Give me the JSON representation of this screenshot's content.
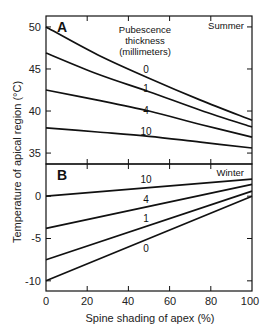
{
  "chart_data": [
    {
      "type": "line",
      "panel": "A",
      "season": "Summer",
      "title": "",
      "xlabel": "Spine shading of apex (%)",
      "ylabel": "Temperature of apical region (°C)",
      "xlim": [
        0,
        100
      ],
      "ylim": [
        33.7,
        51.3
      ],
      "yticks": [
        35,
        40,
        45,
        50
      ],
      "xticks": [
        0,
        20,
        40,
        60,
        80,
        100
      ],
      "legend_title": [
        "Pubescence",
        "thickness",
        "(millimeters)"
      ],
      "x": [
        0,
        25,
        50,
        75,
        100
      ],
      "series": [
        {
          "name": "0",
          "values": [
            50.0,
            46.7,
            43.9,
            41.3,
            38.9
          ]
        },
        {
          "name": "1",
          "values": [
            46.9,
            44.4,
            42.3,
            40.1,
            38.1
          ]
        },
        {
          "name": "4",
          "values": [
            42.5,
            41.3,
            40.0,
            38.4,
            36.9
          ]
        },
        {
          "name": "10",
          "values": [
            38.0,
            37.5,
            37.0,
            36.3,
            35.6
          ]
        }
      ],
      "grid": false
    },
    {
      "type": "line",
      "panel": "B",
      "season": "Winter",
      "title": "",
      "xlabel": "Spine shading of apex (%)",
      "ylabel": "Temperature of apical region (°C)",
      "xlim": [
        0,
        100
      ],
      "ylim": [
        -11.2,
        3.8
      ],
      "yticks": [
        -10,
        -5,
        0
      ],
      "xticks": [
        0,
        20,
        40,
        60,
        80,
        100
      ],
      "x": [
        0,
        100
      ],
      "series": [
        {
          "name": "10",
          "values": [
            0.0,
            2.0
          ]
        },
        {
          "name": "4",
          "values": [
            -3.8,
            1.4
          ]
        },
        {
          "name": "1",
          "values": [
            -7.5,
            0.6
          ]
        },
        {
          "name": "0",
          "values": [
            -10.0,
            0.0
          ]
        }
      ],
      "grid": false
    }
  ],
  "labels": {
    "panel_a": "A",
    "panel_b": "B",
    "season_a": "Summer",
    "season_b": "Winter",
    "legend_line1": "Pubescence",
    "legend_line2": "thickness",
    "legend_line3": "(millimeters)",
    "ylabel": "Temperature of apical region  (°C)",
    "xlabel": "Spine shading of apex  (%)",
    "a_curve_labels": [
      "0",
      "1",
      "4",
      "10"
    ],
    "b_curve_labels": [
      "10",
      "4",
      "1",
      "0"
    ],
    "a_yticks": [
      "50",
      "45",
      "40",
      "35"
    ],
    "b_yticks": [
      "0",
      "-5",
      "-10"
    ],
    "xticks": [
      "0",
      "20",
      "40",
      "60",
      "80",
      "100"
    ]
  }
}
